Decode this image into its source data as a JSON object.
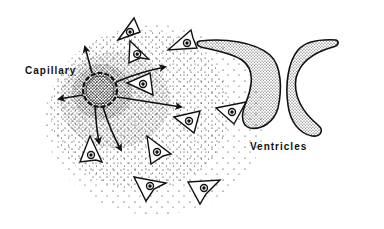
{
  "diagram": {
    "labels": {
      "capillary": "Capillary",
      "ventricles": "Ventricles"
    },
    "colors": {
      "ink": "#111111",
      "background": "#ffffff"
    },
    "elements": {
      "capillary": {
        "cx": 100,
        "cy": 90,
        "r": 17
      },
      "arrows": [
        {
          "name": "arrow-up",
          "x1": 92,
          "y1": 73,
          "x2": 84,
          "y2": 45
        },
        {
          "name": "arrow-left",
          "x1": 83,
          "y1": 95,
          "x2": 57,
          "y2": 99
        },
        {
          "name": "arrow-upper-right",
          "x1": 116,
          "y1": 82,
          "x2": 165,
          "y2": 67
        },
        {
          "name": "arrow-right",
          "x1": 117,
          "y1": 97,
          "x2": 183,
          "y2": 107
        },
        {
          "name": "arrow-down",
          "x1": 103,
          "y1": 107,
          "x2": 122,
          "y2": 150
        },
        {
          "name": "arrow-down-left",
          "x1": 95,
          "y1": 107,
          "x2": 100,
          "y2": 145
        }
      ],
      "cells": [
        {
          "x": 138,
          "y": 50,
          "rot": -10
        },
        {
          "x": 180,
          "y": 42,
          "rot": 5
        },
        {
          "x": 140,
          "y": 82,
          "rot": -20
        },
        {
          "x": 90,
          "y": 150,
          "rot": -10
        },
        {
          "x": 160,
          "y": 148,
          "rot": 15
        },
        {
          "x": 150,
          "y": 185,
          "rot": 10
        },
        {
          "x": 205,
          "y": 190,
          "rot": 0
        },
        {
          "x": 190,
          "y": 124,
          "rot": -5
        },
        {
          "x": 232,
          "y": 111,
          "rot": 10
        },
        {
          "x": 130,
          "y": 28,
          "rot": 0
        }
      ]
    }
  }
}
